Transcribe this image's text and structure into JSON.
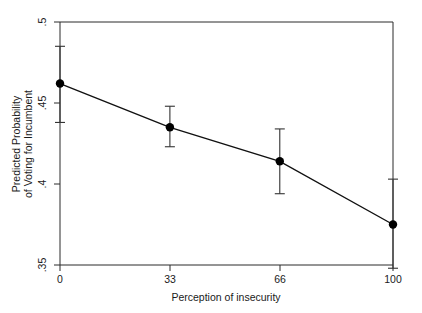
{
  "chart_data": {
    "type": "line",
    "title": "",
    "subtitle": "",
    "xlabel": "Perception of insecurity",
    "ylabel": "Predicted Probability of Voting for Incumbent",
    "ylabel_line1": "Predicted Probability",
    "ylabel_line2": "of Voting for Incumbent",
    "x": [
      0,
      33,
      66,
      100
    ],
    "xtick_labels": [
      "0",
      "33",
      "66",
      "100"
    ],
    "ytick_labels": [
      ".5",
      ".45",
      ".4",
      ".35"
    ],
    "ytick_values": [
      0.5,
      0.45,
      0.4,
      0.35
    ],
    "xlim": [
      0,
      100
    ],
    "ylim": [
      0.35,
      0.5
    ],
    "grid": false,
    "legend": false,
    "legend_position": "none",
    "series": [
      {
        "name": "Predicted probability of voting for incumbent",
        "values": [
          0.462,
          0.435,
          0.414,
          0.375
        ],
        "error_low": [
          0.438,
          0.423,
          0.394,
          0.348
        ],
        "error_high": [
          0.485,
          0.448,
          0.434,
          0.403
        ],
        "marker": "filled-circle",
        "color": "#000000"
      }
    ],
    "annotations": []
  },
  "figure": {
    "background_color": "#ffffff",
    "frame_color": "#2b2b2b",
    "line_color": "#111111",
    "errorbar_color": "#333333"
  }
}
